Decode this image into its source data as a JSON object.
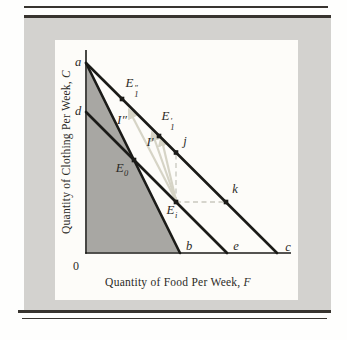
{
  "colors": {
    "panel": "#d3d2cf",
    "chart_bg": "#fdfcf9",
    "rule": "#38342f",
    "line": "#1b1b18",
    "shade": "#a8a7a3",
    "arrow": "#d6d4c6",
    "dash": "#c9c8bf",
    "text": "#2b2a26",
    "page": "#fefefd"
  },
  "axes": {
    "y_title": "Quantity of Clothing Per Week,",
    "y_var": "C",
    "x_title": "Quantity of Food Per Week,",
    "x_var": "F",
    "origin": "0"
  },
  "axis_labels": {
    "a": "a",
    "d": "d",
    "b": "b",
    "e": "e",
    "c": "c"
  },
  "points": {
    "e0": {
      "base": "E",
      "sub": "0"
    },
    "ei": {
      "base": "E",
      "sub": "i"
    },
    "e1p": {
      "base": "E",
      "prime": "′",
      "sub": "1"
    },
    "e1pp": {
      "base": "E",
      "prime": "″",
      "sub": "1"
    },
    "j": "j",
    "k": "k"
  },
  "curve_labels": {
    "ip": {
      "base": "I",
      "prime": "′"
    },
    "ipp": {
      "base": "I",
      "prime": "″"
    }
  }
}
